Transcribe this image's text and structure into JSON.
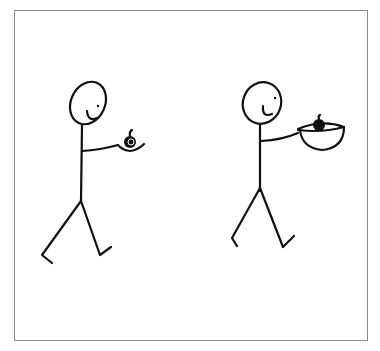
{
  "illustration": {
    "description": "Comic panel with two walking stick figures",
    "figures": [
      {
        "label": "stick figure holding apple in hand",
        "held_item": "apple"
      },
      {
        "label": "stick figure holding apple in bowl",
        "held_item": "apple in bowl"
      }
    ],
    "ink_color": "#111111",
    "frame_color": "#8a8a8a",
    "background_color": "#ffffff"
  }
}
